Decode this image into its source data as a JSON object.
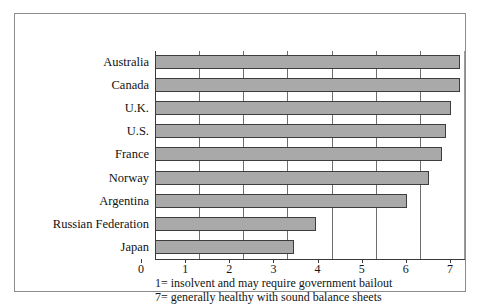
{
  "chart_data": {
    "type": "bar",
    "orientation": "horizontal",
    "title": "",
    "xlabel": "",
    "ylabel": "",
    "xlim": [
      0,
      7
    ],
    "xticks": [
      "0",
      "1",
      "2",
      "3",
      "4",
      "5",
      "6",
      "7"
    ],
    "grid": true,
    "legend": "none",
    "categories": [
      "Australia",
      "Canada",
      "U.K.",
      "U.S.",
      "France",
      "Norway",
      "Argentina",
      "Russian Federation",
      "Japan"
    ],
    "values": [
      6.9,
      6.9,
      6.7,
      6.6,
      6.5,
      6.2,
      5.7,
      3.65,
      3.15
    ],
    "annotations": [
      "1= insolvent and may require government bailout",
      "7= generally healthy with sound balance sheets"
    ],
    "colors": {
      "bar_fill": "#a9a9a9",
      "bar_border": "#3d3d3d",
      "axis": "#3a3a3a",
      "gridline": "#6e6e6e",
      "frame": "#8c8c8c",
      "background": "#ffffff",
      "text": "#141414"
    }
  }
}
